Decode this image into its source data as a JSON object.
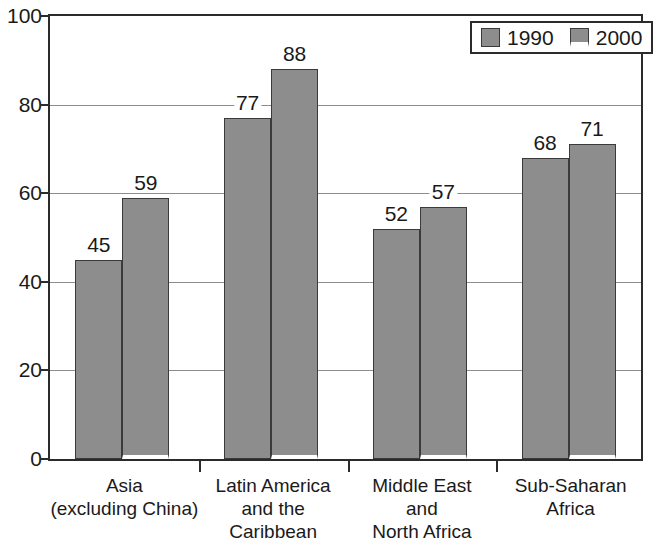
{
  "chart_data": {
    "type": "bar",
    "title": "",
    "subtitle": "",
    "xlabel": "",
    "ylabel": "",
    "ylim": [
      0,
      100
    ],
    "yticks": [
      0,
      20,
      40,
      60,
      80,
      100
    ],
    "ytick_labels": [
      "0",
      "20",
      "40",
      "60",
      "80",
      "100"
    ],
    "grid": true,
    "legend_position": "top-right",
    "categories": [
      "Asia (excluding China)",
      "Latin America and the Caribbean",
      "Middle East and North Africa",
      "Sub-Saharan Africa"
    ],
    "category_label_lines": [
      [
        "Asia",
        "(excluding China)"
      ],
      [
        "Latin America",
        "and the",
        "Caribbean"
      ],
      [
        "Middle East",
        "and",
        "North Africa"
      ],
      [
        "Sub-Saharan",
        "Africa"
      ]
    ],
    "series": [
      {
        "name": "1990",
        "color": "#8d8d8d",
        "values": [
          45,
          77,
          52,
          68
        ],
        "value_labels": [
          "45",
          "77",
          "52",
          "68"
        ]
      },
      {
        "name": "2000",
        "color": "#8d8d8d",
        "values": [
          59,
          88,
          57,
          71
        ],
        "value_labels": [
          "59",
          "88",
          "57",
          "71"
        ]
      }
    ]
  },
  "legend": {
    "items": [
      {
        "label": "1990",
        "swatch": "legend-swatch-1990"
      },
      {
        "label": "2000",
        "swatch": "legend-swatch-2000"
      }
    ]
  },
  "colors": {
    "bar_fill": "#8d8d8d",
    "bar_border": "#3a3a3a",
    "frame": "#2b2b2b",
    "gridline": "#8d8d8d",
    "background": "#ffffff",
    "text": "#1a1a1a"
  }
}
